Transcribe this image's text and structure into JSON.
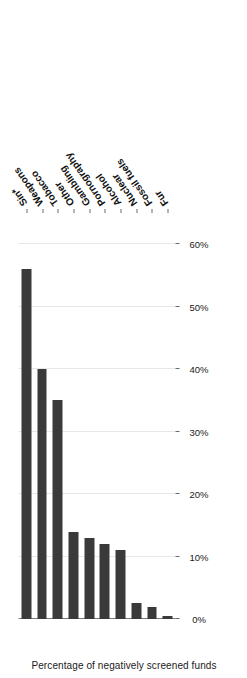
{
  "chart_data": {
    "type": "bar",
    "orientation": "horizontal-rotated",
    "title": "",
    "subtitle": "",
    "xlabel": "",
    "ylabel": "Percentage of negatively screened funds",
    "value_axis_label": "Percentage of negatively screened funds",
    "categories": [
      "Sin*",
      "Weapons",
      "Tobacco",
      "Other",
      "Gambling",
      "Pornography",
      "Alcohol",
      "Nuclear",
      "Fossil fuels",
      "Fur"
    ],
    "values": [
      56,
      40,
      35,
      14,
      13,
      12,
      11,
      2.5,
      2,
      0.5
    ],
    "value_suffix": "%",
    "ticks": [
      0,
      10,
      20,
      30,
      40,
      50,
      60
    ],
    "tick_labels": [
      "0%",
      "10%",
      "20%",
      "30%",
      "40%",
      "50%",
      "60%"
    ],
    "ylim": [
      0,
      65
    ],
    "grid": true,
    "grid_axis": "value",
    "legend": false,
    "legend_position": "none",
    "bar_color": "#3a3a3a",
    "grid_color": "#e8e8e8",
    "axis_color": "#7a7a7a",
    "background_color": "#ffffff"
  }
}
